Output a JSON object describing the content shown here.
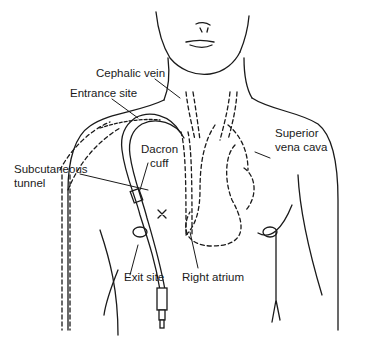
{
  "figure": {
    "labels": {
      "cephalic_vein": "Cephalic vein",
      "entrance_site": "Entrance site",
      "superior_vena_cava_1": "Superior",
      "superior_vena_cava_2": "vena cava",
      "dacron_cuff_1": "Dacron",
      "dacron_cuff_2": "cuff",
      "subcutaneous_tunnel_1": "Subcutaneous",
      "subcutaneous_tunnel_2": "tunnel",
      "exit_site": "Exit site",
      "right_atrium": "Right atrium"
    },
    "colors": {
      "line": "#1a1a1a",
      "background": "#ffffff"
    }
  }
}
